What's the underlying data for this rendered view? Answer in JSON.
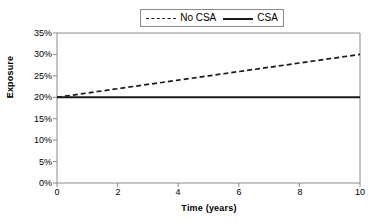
{
  "chart_data": {
    "type": "line",
    "title": "",
    "xlabel": "Time (years)",
    "ylabel": "Exposure",
    "xlim": [
      0,
      10
    ],
    "ylim": [
      0,
      35
    ],
    "grid": false,
    "legend_position": "top-center",
    "x": [
      0,
      1,
      2,
      3,
      4,
      5,
      6,
      7,
      8,
      9,
      10
    ],
    "series": [
      {
        "name": "No CSA",
        "style": "dashed",
        "color": "#1a1a1a",
        "values": [
          20,
          21,
          22,
          23,
          24,
          25,
          26,
          27,
          28,
          29,
          30
        ]
      },
      {
        "name": "CSA",
        "style": "solid",
        "color": "#1a1a1a",
        "values": [
          20,
          20,
          20,
          20,
          20,
          20,
          20,
          20,
          20,
          20,
          20
        ]
      }
    ],
    "xticks": [
      0,
      2,
      4,
      6,
      8,
      10
    ],
    "xtick_labels": [
      "0",
      "2",
      "4",
      "6",
      "8",
      "10"
    ],
    "yticks": [
      0,
      5,
      10,
      15,
      20,
      25,
      30,
      35
    ],
    "ytick_labels": [
      "0%",
      "5%",
      "10%",
      "15%",
      "20%",
      "25%",
      "30%",
      "35%"
    ]
  },
  "legend": {
    "entries": [
      {
        "label": "No CSA",
        "swatch": "dashed-line-swatch"
      },
      {
        "label": "CSA",
        "swatch": "solid-line-swatch"
      }
    ]
  },
  "axes": {
    "y_title": "Exposure",
    "x_title": "Time (years)"
  },
  "colors": {
    "line": "#1a1a1a",
    "frame": "#8a8a8a",
    "background": "#ffffff",
    "text": "#000000"
  }
}
